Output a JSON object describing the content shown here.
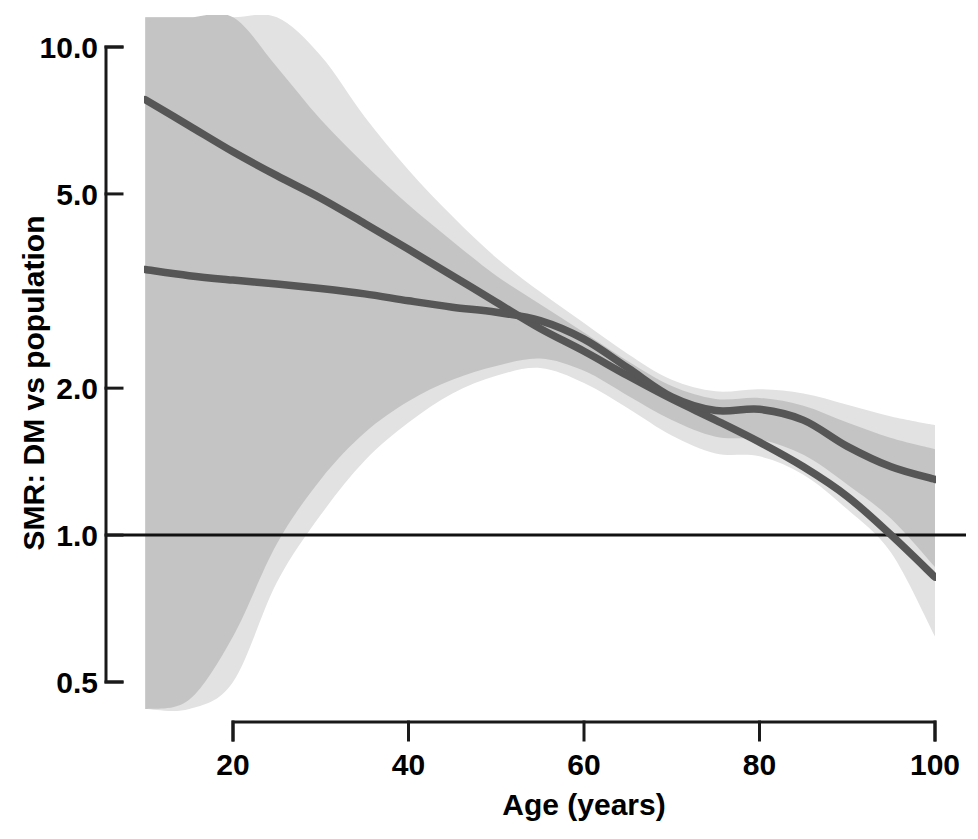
{
  "chart_data": {
    "type": "line",
    "title": "",
    "xlabel": "Age (years)",
    "ylabel": "SMR: DM vs population",
    "xlim": [
      10,
      100
    ],
    "ylim": [
      0.44,
      11.5
    ],
    "yscale": "log",
    "grid": false,
    "legend": "none",
    "xticks": [
      20,
      40,
      60,
      80,
      100
    ],
    "xtick_labels": [
      "20",
      "40",
      "60",
      "80",
      "100"
    ],
    "yticks": [
      0.5,
      1.0,
      2.0,
      5.0,
      10.0
    ],
    "ytick_labels": [
      "0.5",
      "1.0",
      "2.0",
      "5.0",
      "10.0"
    ],
    "reference_line": {
      "name": "null-effect-line",
      "y": 1.0,
      "color": "#111111"
    },
    "colors": {
      "line": "#565656",
      "band_inner": "#c4c4c4",
      "band_outer": "#e2e2e2",
      "axis": "#1a1a1a",
      "background": "#ffffff"
    },
    "series": [
      {
        "name": "steep-trend",
        "label": "Cohort A (steeper decline)",
        "color": "#565656",
        "x": [
          10,
          15,
          20,
          25,
          30,
          35,
          40,
          45,
          50,
          55,
          60,
          65,
          70,
          75,
          80,
          85,
          90,
          95,
          100
        ],
        "y": [
          7.8,
          6.9,
          6.1,
          5.45,
          4.9,
          4.35,
          3.85,
          3.4,
          3.0,
          2.65,
          2.38,
          2.12,
          1.9,
          1.72,
          1.55,
          1.38,
          1.2,
          1.0,
          0.82
        ]
      },
      {
        "name": "flat-trend",
        "label": "Cohort B (flatter decline)",
        "color": "#565656",
        "x": [
          10,
          15,
          20,
          25,
          30,
          35,
          40,
          45,
          50,
          55,
          60,
          65,
          70,
          75,
          80,
          85,
          90,
          95,
          100
        ],
        "y": [
          3.5,
          3.4,
          3.33,
          3.27,
          3.2,
          3.12,
          3.02,
          2.93,
          2.86,
          2.75,
          2.52,
          2.2,
          1.92,
          1.8,
          1.81,
          1.72,
          1.52,
          1.38,
          1.3
        ]
      }
    ],
    "bands": [
      {
        "name": "outer-confidence-band",
        "level": "95%",
        "color": "#e2e2e2",
        "x": [
          10,
          15,
          20,
          25,
          30,
          35,
          40,
          45,
          50,
          55,
          60,
          65,
          70,
          75,
          80,
          85,
          90,
          95,
          100
        ],
        "upper": [
          11.5,
          11.5,
          11.5,
          11.5,
          9.6,
          7.2,
          5.6,
          4.5,
          3.7,
          3.15,
          2.72,
          2.35,
          2.08,
          1.97,
          1.99,
          1.95,
          1.85,
          1.75,
          1.68
        ],
        "lower": [
          0.44,
          0.44,
          0.5,
          0.8,
          1.1,
          1.42,
          1.7,
          1.95,
          2.12,
          2.2,
          2.05,
          1.82,
          1.6,
          1.47,
          1.45,
          1.33,
          1.13,
          0.92,
          0.62
        ]
      },
      {
        "name": "inner-confidence-band",
        "level": "80%",
        "color": "#c4c4c4",
        "x": [
          10,
          15,
          20,
          25,
          30,
          35,
          40,
          45,
          50,
          55,
          60,
          65,
          70,
          75,
          80,
          85,
          90,
          95,
          100
        ],
        "upper": [
          11.5,
          11.5,
          11.5,
          9.1,
          7.1,
          5.75,
          4.75,
          4.0,
          3.4,
          2.97,
          2.6,
          2.27,
          2.02,
          1.9,
          1.91,
          1.84,
          1.7,
          1.58,
          1.5
        ],
        "lower": [
          0.44,
          0.46,
          0.62,
          0.96,
          1.3,
          1.62,
          1.88,
          2.08,
          2.22,
          2.3,
          2.17,
          1.93,
          1.72,
          1.59,
          1.57,
          1.46,
          1.27,
          1.08,
          0.86
        ]
      }
    ]
  },
  "axes": {
    "x_axis_name": "x-axis",
    "y_axis_name": "y-axis"
  }
}
